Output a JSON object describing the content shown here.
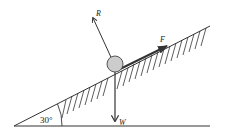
{
  "diagram": {
    "incline_angle_label": "30°",
    "forces": {
      "reaction": {
        "label": "R"
      },
      "friction": {
        "label": "F"
      },
      "weight": {
        "label": "W"
      }
    },
    "colors": {
      "line": "#333333",
      "ball_fill": "#cccccc",
      "ball_stroke": "#555555"
    }
  }
}
